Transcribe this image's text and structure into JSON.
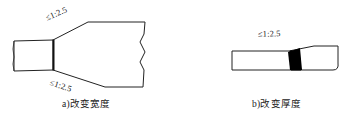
{
  "figure": {
    "background_color": "#ffffff",
    "line_color": "#222222",
    "fill_color": "#000000"
  },
  "panel_a": {
    "caption": "a)改变宽度",
    "slope_label_top": "≤1:2.5",
    "slope_label_bottom": "≤1:2.5"
  },
  "panel_b": {
    "caption": "b)改变厚度",
    "slope_label": "≤1:2.5"
  }
}
